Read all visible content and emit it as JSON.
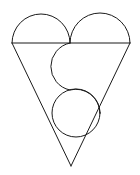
{
  "figure": {
    "canvas": {
      "width": 140,
      "height": 175,
      "background_color": "#ffffff"
    },
    "style": {
      "stroke_color": "#1a1a1a",
      "stroke_width": 1,
      "fill": "none"
    },
    "geometry": {
      "horizontal_line": {
        "name": "diameter-line",
        "x1": 12,
        "y1": 43,
        "x2": 130,
        "y2": 43
      },
      "left_lobe": {
        "name": "left-semicircle",
        "center_x": 41,
        "center_y": 43,
        "radius": 29,
        "sweep": "upper-half"
      },
      "right_lobe": {
        "name": "right-semicircle",
        "center_x": 100,
        "center_y": 43,
        "radius": 30,
        "sweep": "upper-half"
      },
      "triangle": {
        "name": "inverted-triangle",
        "vertex_left_x": 12,
        "vertex_left_y": 43,
        "vertex_right_x": 130,
        "vertex_right_y": 43,
        "apex_x": 71,
        "apex_y": 166
      },
      "s_curve_upper_arc": {
        "name": "s-curve-upper-arc",
        "center_x": 70,
        "center_y": 67,
        "radius": 24,
        "start_x": 70,
        "start_y": 43,
        "end_x": 70,
        "end_y": 90
      },
      "s_curve_lower_circle": {
        "name": "lower-circle",
        "center_x": 76,
        "center_y": 113,
        "radius": 24
      }
    },
    "labels": {
      "shape_name": "Heart",
      "parts_count": "5"
    }
  }
}
